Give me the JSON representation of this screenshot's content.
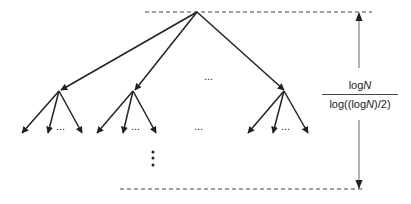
{
  "diagram": {
    "type": "tree",
    "height_label": {
      "numerator_prefix": "log",
      "numerator_var": "N",
      "denominator_prefix": "log((log",
      "denominator_var": "N",
      "denominator_suffix": ")/2)"
    },
    "ellipses": {
      "level1_between": "...",
      "leaves_group1": "...",
      "leaves_group2": "...",
      "leaves_between": "...",
      "leaves_group3": "...",
      "vertical_continuation": "⋮"
    },
    "colors": {
      "line": "#222222",
      "dashed": "#444444",
      "dimension_line": "#666666",
      "background": "#ffffff"
    },
    "nodes": {
      "root": {
        "x": 197,
        "y": 12
      },
      "level1": [
        {
          "x": 61,
          "y": 90
        },
        {
          "x": 135,
          "y": 90
        },
        {
          "x": 284,
          "y": 90
        }
      ],
      "leaves": [
        [
          {
            "x": 22,
            "y": 133
          },
          {
            "x": 48,
            "y": 133
          },
          {
            "x": 82,
            "y": 133
          }
        ],
        [
          {
            "x": 97,
            "y": 133
          },
          {
            "x": 123,
            "y": 133
          },
          {
            "x": 156,
            "y": 133
          }
        ],
        [
          {
            "x": 248,
            "y": 133
          },
          {
            "x": 273,
            "y": 133
          },
          {
            "x": 308,
            "y": 133
          }
        ]
      ]
    }
  }
}
